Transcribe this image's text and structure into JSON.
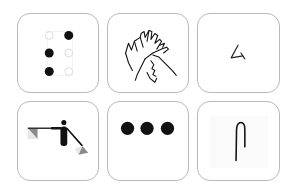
{
  "tiles": [
    {
      "id": "braille",
      "label": "Braille",
      "icon": "braille-cell-icon"
    },
    {
      "id": "sign-language",
      "label": "Sign language",
      "icon": "signing-hands-icon"
    },
    {
      "id": "written-character",
      "label": "Written character",
      "icon": "character-glyph-icon"
    },
    {
      "id": "semaphore",
      "label": "Flag semaphore",
      "icon": "semaphore-flags-icon"
    },
    {
      "id": "morse",
      "label": "Morse code",
      "icon": "three-dots-icon"
    },
    {
      "id": "handwritten-stroke",
      "label": "Handwritten stroke",
      "icon": "stroke-glyph-icon"
    }
  ],
  "colors": {
    "tile_border": "#b9b9b9",
    "ink": "#111111",
    "faint_dot": "#dcdcdc",
    "flag_dark": "#8a8a8a",
    "flag_light": "#e6e6e6"
  }
}
